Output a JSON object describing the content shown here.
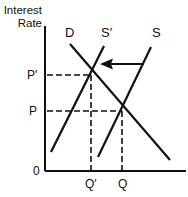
{
  "diagram": {
    "title": "",
    "y_axis_label_line1": "Interest",
    "y_axis_label_line2": "Rate",
    "origin_label": "0",
    "curves": {
      "demand": "D",
      "supply_new": "S′",
      "supply_original": "S"
    },
    "y_ticks": {
      "new_price": "P′",
      "original_price": "P"
    },
    "x_ticks": {
      "new_quantity": "Q′",
      "original_quantity": "Q"
    },
    "arrow": "shift of supply from S to S′ (leftward)",
    "colors": {
      "ink": "#111111",
      "background": "#ffffff"
    }
  }
}
